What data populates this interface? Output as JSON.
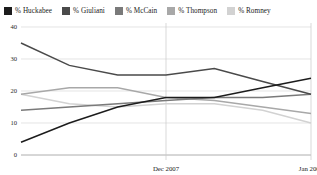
{
  "legend": {
    "items": [
      {
        "label": "% Huckabee",
        "color": "#1c1c1c",
        "swatch_name": "legend-swatch-huckabee"
      },
      {
        "label": "% Giuliani",
        "color": "#4a4a4a",
        "swatch_name": "legend-swatch-giuliani"
      },
      {
        "label": "% McCain",
        "color": "#7a7a7a",
        "swatch_name": "legend-swatch-mccain"
      },
      {
        "label": "% Thompson",
        "color": "#a8a8a8",
        "swatch_name": "legend-swatch-thompson"
      },
      {
        "label": "% Romney",
        "color": "#d2d2d2",
        "swatch_name": "legend-swatch-romney"
      }
    ]
  },
  "axes": {
    "y_ticks": [
      "0",
      "10",
      "20",
      "30",
      "40"
    ],
    "x_ticks": [
      "Dec 2007",
      "Jan 2008"
    ]
  },
  "chart_data": {
    "type": "line",
    "title": "",
    "subtitle": "",
    "xlabel": "",
    "ylabel": "",
    "ylim": [
      0,
      40
    ],
    "grid": true,
    "legend_position": "top",
    "x": [
      0,
      1,
      2,
      3,
      4,
      5,
      6
    ],
    "x_tick_positions": [
      3,
      6
    ],
    "x_tick_labels": [
      "Dec 2007",
      "Jan 2008"
    ],
    "y_ticks": [
      0,
      10,
      20,
      30,
      40
    ],
    "series": [
      {
        "name": "% Huckabee",
        "color": "#1c1c1c",
        "values": [
          4,
          10,
          15,
          18,
          18,
          21,
          24
        ]
      },
      {
        "name": "% Giuliani",
        "color": "#4a4a4a",
        "values": [
          35,
          28,
          25,
          25,
          27,
          23,
          19
        ]
      },
      {
        "name": "% McCain",
        "color": "#7a7a7a",
        "values": [
          14,
          15,
          16,
          17,
          18,
          18,
          19
        ]
      },
      {
        "name": "% Thompson",
        "color": "#a8a8a8",
        "values": [
          19,
          21,
          21,
          18,
          17,
          15,
          13
        ]
      },
      {
        "name": "% Romney",
        "color": "#d2d2d2",
        "values": [
          19,
          16,
          15,
          16,
          16,
          14,
          10
        ]
      }
    ]
  }
}
